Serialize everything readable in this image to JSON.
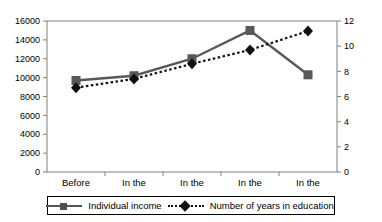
{
  "chart_data": {
    "type": "line",
    "title": "",
    "xlabel": "",
    "categories": [
      "Before 1949",
      "In the 1950s",
      "In the 1960s",
      "In the 1970s",
      "In the 1980s"
    ],
    "categories_lines": [
      [
        "Before",
        "1949"
      ],
      [
        "In the",
        "1950s"
      ],
      [
        "In the",
        "1960s"
      ],
      [
        "In the",
        "1970s"
      ],
      [
        "In the",
        "1980s"
      ]
    ],
    "grid": false,
    "legend_position": "bottom",
    "axes": {
      "left": {
        "label": "",
        "ylim": [
          0,
          16000
        ],
        "ticks": [
          0,
          2000,
          4000,
          6000,
          8000,
          10000,
          12000,
          14000,
          16000
        ],
        "tick_labels": [
          "0",
          "2000",
          "4000",
          "6000",
          "8000",
          "10000",
          "12000",
          "14000",
          "16000"
        ]
      },
      "right": {
        "label": "",
        "ylim": [
          0,
          12
        ],
        "ticks": [
          0,
          2,
          4,
          6,
          8,
          10,
          12
        ],
        "tick_labels": [
          "0",
          "2",
          "4",
          "6",
          "8",
          "10",
          "12"
        ]
      }
    },
    "series": [
      {
        "name": "Individual income",
        "axis": "left",
        "marker": "square",
        "linestyle": "solid",
        "color": "#595959",
        "values": [
          9700,
          10200,
          12000,
          15000,
          10300
        ]
      },
      {
        "name": "Number of years in education",
        "axis": "right",
        "marker": "diamond",
        "linestyle": "dotted",
        "color": "#111111",
        "values": [
          6.7,
          7.4,
          8.6,
          9.7,
          11.2
        ]
      }
    ]
  },
  "legend": {
    "items": [
      {
        "label": "Individual income",
        "symbol": "solid-line-square-marker"
      },
      {
        "label": "Number of years in education",
        "symbol": "dotted-line-diamond-marker"
      }
    ]
  },
  "colors": {
    "income_line": "#595959",
    "education_line": "#111111",
    "axis": "#808080",
    "text": "#000000",
    "background": "#ffffff"
  }
}
